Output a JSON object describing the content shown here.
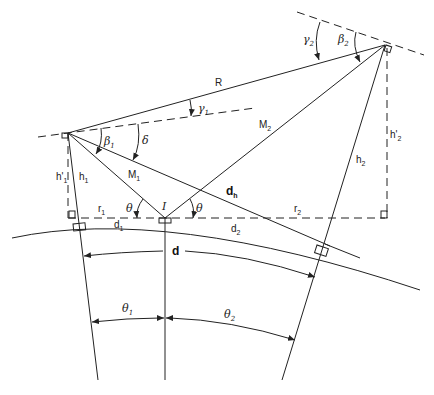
{
  "diagram": {
    "points": {
      "transmitter": "T1",
      "receiver": "T2",
      "reflection_point": "I"
    },
    "labels": {
      "R": "R",
      "M1": "M",
      "M1_sub": "1",
      "M2": "M",
      "M2_sub": "2",
      "dh": "d",
      "dh_sub": "h",
      "I": "I",
      "theta_left": "θ",
      "theta_right": "θ",
      "delta": "δ",
      "beta1": "β",
      "beta1_sub": "1",
      "beta2": "β",
      "beta2_sub": "2",
      "gamma1": "γ",
      "gamma1_sub": "1",
      "gamma2": "γ",
      "gamma2_sub": "2",
      "h1": "h",
      "h1_sub": "1",
      "h1p": "h'",
      "h1p_sub": "1",
      "h2": "h",
      "h2_sub": "2",
      "h2p": "h'",
      "h2p_sub": "2",
      "r1": "r",
      "r1_sub": "1",
      "r2": "r",
      "r2_sub": "2",
      "d1": "d",
      "d1_sub": "1",
      "d2": "d",
      "d2_sub": "2",
      "d": "d",
      "theta1": "θ",
      "theta1_sub": "1",
      "theta2": "θ",
      "theta2_sub": "2"
    }
  }
}
